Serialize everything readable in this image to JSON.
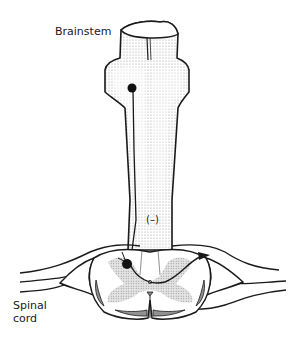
{
  "diagram": {
    "labels": {
      "brainstem": "Brainstem",
      "spinal_cord": "Spinal cord",
      "inhibition_sign": "(–)"
    },
    "colors": {
      "outline": "#1a1a1a",
      "stipple": "#bdbdbd",
      "grey_matter": "#cfcfcf",
      "dark_horn": "#8a8a8a",
      "background": "#ffffff"
    },
    "elements": [
      "brainstem-body",
      "descending-axon",
      "brainstem-neuron-soma",
      "spinal-cord-cross-section",
      "grey-matter-butterfly",
      "dorsal-horn-neuron-soma",
      "ascending-fiber-arrow",
      "spinal-nerve-roots"
    ]
  }
}
